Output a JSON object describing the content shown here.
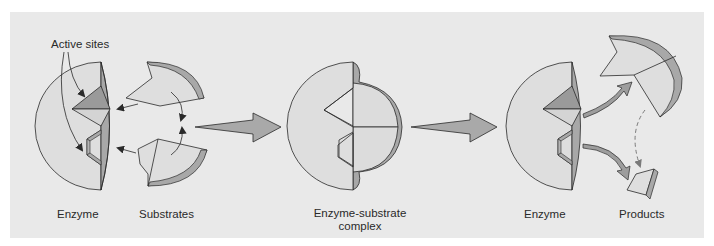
{
  "diagram": {
    "colors": {
      "panel_background": "#e9e9e9",
      "body_fill": "#dedede",
      "edge_fill": "#a8a8a8",
      "active_site_dark": "#9a9a9a",
      "stroke": "#2a2a2a",
      "big_arrow_fill": "#a9a9a9",
      "curved_arrow_fill": "#9d9d9d",
      "dashed_arrow": "#8a8a8a"
    },
    "stages": [
      {
        "id": "enzyme-1",
        "label": "Enzyme"
      },
      {
        "id": "substrates",
        "label": "Substrates"
      },
      {
        "id": "complex",
        "label_line1": "Enzyme-substrate",
        "label_line2": "complex"
      },
      {
        "id": "enzyme-2",
        "label": "Enzyme"
      },
      {
        "id": "products",
        "label": "Products"
      }
    ],
    "annotations": {
      "active_sites": "Active sites"
    },
    "transitions": [
      {
        "from": "substrates",
        "to": "complex",
        "type": "block-arrow"
      },
      {
        "from": "complex",
        "to": "enzyme-2",
        "type": "block-arrow"
      },
      {
        "from": "enzyme-2",
        "to": "products",
        "type": "curved-arrow"
      },
      {
        "from": "product-large",
        "to": "product-small",
        "type": "dashed-arrow"
      }
    ]
  }
}
